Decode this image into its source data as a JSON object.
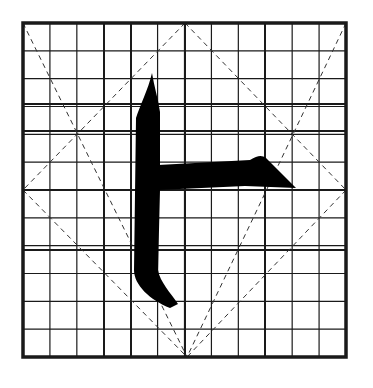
{
  "figure": {
    "colors": {
      "background": "#ffffff",
      "grid": "#1a1a1a",
      "ink": "#000000",
      "dash": "#333333"
    },
    "grid": {
      "left": 23,
      "top": 23,
      "right": 346,
      "bottom": 357,
      "columns": 12,
      "rows": 12,
      "thick_x": [
        23,
        104,
        131,
        185,
        265,
        346
      ],
      "thick_y": [
        23,
        104,
        131,
        190,
        250,
        357
      ]
    },
    "guides": [
      {
        "x1": 185,
        "y1": 23,
        "x2": 23,
        "y2": 190
      },
      {
        "x1": 185,
        "y1": 23,
        "x2": 346,
        "y2": 190
      },
      {
        "x1": 23,
        "y1": 190,
        "x2": 187,
        "y2": 357
      },
      {
        "x1": 346,
        "y1": 190,
        "x2": 187,
        "y2": 357
      },
      {
        "x1": 23,
        "y1": 23,
        "x2": 187,
        "y2": 357
      },
      {
        "x1": 346,
        "y1": 23,
        "x2": 187,
        "y2": 357
      }
    ],
    "strokes": [
      {
        "name": "vertical",
        "d": "M152,73 C148,90 140,105 136,118 L134,270 C134,285 150,300 170,308 L178,304 C170,292 160,282 158,270 L160,190 L160,112 C158,98 154,86 152,73 Z"
      },
      {
        "name": "horizontal",
        "d": "M158,165 L250,160 C258,155 262,155 266,158 L296,188 L245,186 L158,190 Z"
      }
    ]
  }
}
